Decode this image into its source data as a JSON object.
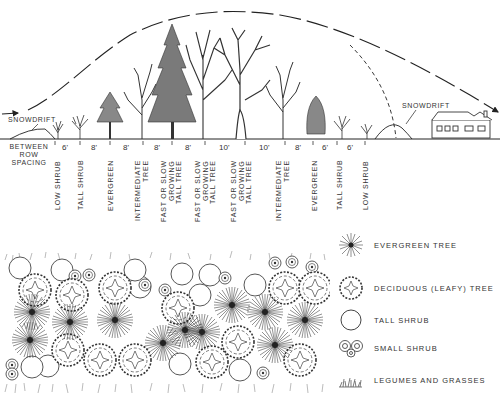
{
  "profile": {
    "snowdrift_left": "SNOWDRIFT",
    "snowdrift_right": "SNOWDRIFT",
    "between_row_label": [
      "BETWEEN",
      "ROW",
      "SPACING"
    ],
    "spacings": [
      "6'",
      "8'",
      "8'",
      "8'",
      "8'",
      "10'",
      "10'",
      "8'",
      "6'",
      "6'"
    ],
    "rows": [
      "LOW SHRUB",
      "TALL SHRUB",
      "EVERGREEN",
      "INTERMEDIATE\nTREE",
      "FAST OR SLOW\nGROWING\nTALL TREE",
      "FAST OR SLOW\nGROWING\nTALL TREE",
      "FAST OR SLOW\nGROWING\nTALL TREE",
      "INTERMEDIATE\nTREE",
      "EVERGREEN",
      "TALL SHRUB",
      "LOW SHRUB"
    ]
  },
  "legend": {
    "items": [
      {
        "icon": "evergreen-tree-icon",
        "label": "EVERGREEN TREE"
      },
      {
        "icon": "deciduous-tree-icon",
        "label": "DECIDUOUS (LEAFY) TREE"
      },
      {
        "icon": "tall-shrub-icon",
        "label": "TALL SHRUB"
      },
      {
        "icon": "small-shrub-icon",
        "label": "SMALL SHRUB"
      },
      {
        "icon": "legumes-grasses-icon",
        "label": "LEGUMES AND GRASSES"
      }
    ]
  },
  "colors": {
    "ink": "#222222",
    "background": "#ffffff"
  }
}
